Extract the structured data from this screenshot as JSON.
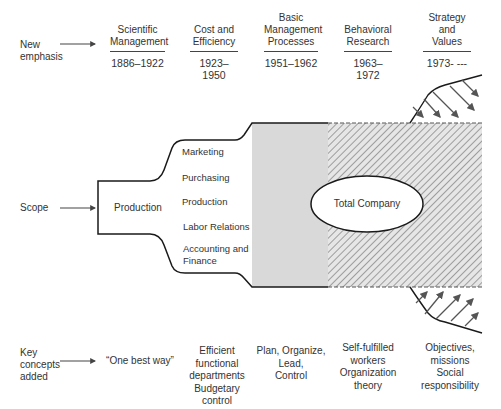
{
  "rows": {
    "new_emphasis_label": [
      "New",
      "emphasis"
    ],
    "scope_label": "Scope",
    "key_concepts_label": [
      "Key",
      "concepts",
      "added"
    ]
  },
  "eras": [
    {
      "name": [
        "Scientific",
        "Management"
      ],
      "years": "1886–1922",
      "concepts": [
        "“One best way”"
      ]
    },
    {
      "name": [
        "Cost and",
        "Efficiency"
      ],
      "years": "1923–1950",
      "concepts": [
        "Efficient",
        "functional",
        "departments",
        "Budgetary",
        "control"
      ]
    },
    {
      "name": [
        "Basic",
        "Management",
        "Processes"
      ],
      "years": "1951–1962",
      "concepts": [
        "Plan, Organize,",
        "Lead,",
        "Control"
      ]
    },
    {
      "name": [
        "Behavioral",
        "Research"
      ],
      "years": "1963–1972",
      "concepts": [
        "Self-fulfilled",
        "workers",
        "Organization",
        "theory"
      ]
    },
    {
      "name": [
        "Strategy",
        "and Values"
      ],
      "years": "1973- ---",
      "concepts": [
        "Objectives,",
        "missions",
        "Social",
        "responsibility"
      ]
    }
  ],
  "scope": {
    "initial": "Production",
    "departments": [
      "Marketing",
      "Purchasing",
      "Production",
      "Labor Relations",
      "Accounting and",
      "Finance"
    ],
    "total": "Total Company"
  },
  "colors": {
    "line": "#1a1a1a",
    "gray_fill": "#d9d9d9",
    "hatch": "#8a8a8a",
    "arrow": "#5a5a5a"
  }
}
